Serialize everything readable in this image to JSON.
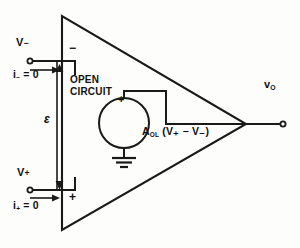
{
  "figure": {
    "kind": "ideal-op-amp-equivalent-circuit",
    "stroke_color": "#1a1a1a",
    "background_color": "#fdfdfb"
  },
  "labels": {
    "inverting_input": "V",
    "inverting_input_sign": "−",
    "inverting_current": "i",
    "inverting_current_sub": "−",
    "inverting_current_value": "= 0",
    "noninverting_input": "V",
    "noninverting_input_sign": "+",
    "noninverting_current": "i",
    "noninverting_current_sub": "+",
    "noninverting_current_value": "= 0",
    "open_circuit_line1": "OPEN",
    "open_circuit_line2": "CIRCUIT",
    "epsilon": "ε",
    "source_gain": "A",
    "source_gain_sub": "OL",
    "source_expression": "(V₊ − V₋)",
    "output": "v",
    "output_sub": "O",
    "terminal_minus_sign": "−",
    "terminal_plus_sign": "+",
    "source_plus_sign": "+"
  },
  "geometry": {
    "triangle_top_left": [
      62,
      16
    ],
    "triangle_bottom_left": [
      62,
      230
    ],
    "triangle_apex": [
      246,
      124
    ],
    "inverting_wire_y": 61,
    "noninverting_wire_y": 190,
    "input_terminal_x": 29,
    "source_circle_center": [
      124,
      123
    ],
    "source_circle_radius": 25,
    "output_terminal": [
      283,
      124
    ]
  }
}
